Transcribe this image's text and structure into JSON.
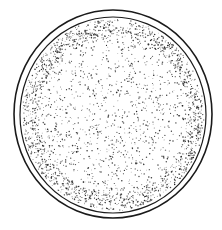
{
  "figure": {
    "style": "black ink line drawing with stipple shading",
    "colors": {
      "ink": "#1a1a1a",
      "background": "#ffffff"
    },
    "outer_wall": {
      "cx": 113,
      "cy": 114,
      "rx": 99,
      "ry": 104
    },
    "inner_body": {
      "cx": 113,
      "cy": 115,
      "rx": 93,
      "ry": 98
    },
    "caption": ""
  }
}
